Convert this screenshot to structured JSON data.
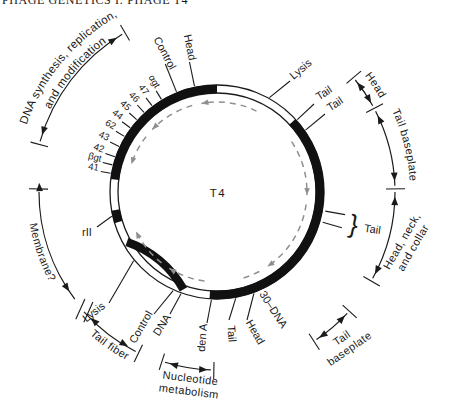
{
  "header": {
    "running_head": "PHAGE GENETICS I: PHAGE T4"
  },
  "map": {
    "center_label": "T4",
    "genes": [
      "41",
      "βgt",
      "42",
      "43",
      "62",
      "44",
      "45",
      "46",
      "47",
      "αgt"
    ],
    "ring_labels": {
      "control_top": "Control",
      "head_top": "Head",
      "lysis_upper": "Lysis",
      "tail_upper_1": "Tail",
      "tail_upper_2": "Tail",
      "tail_brace_label": "Tail",
      "brace_glyph": "}",
      "rii": "rII",
      "lysis_lower": "Lysis",
      "control_bottom": "Control",
      "dna_bottom": "DNA",
      "den_a": "den A",
      "tail_bottom": "Tail",
      "head_bottom": "Head",
      "dna_30": "30–DNA"
    },
    "annotations": {
      "dna_synthesis_line1": "DNA synthesis, replication,",
      "dna_synthesis_line2": "and modification",
      "head_right": "Head",
      "tail_baseplate_right": "Tail baseplate",
      "head_neck_collar_line1": "Head, neck,",
      "head_neck_collar_line2": "and collar",
      "tail_baseplate_bottom_line1": "Tail",
      "tail_baseplate_bottom_line2": "baseplate",
      "membrane": "Membrane?",
      "tail_fiber": "Tail fiber",
      "nucleotide_line1": "Nucleotide",
      "nucleotide_line2": "metabolism"
    },
    "colors": {
      "ink": "#1a1a1a",
      "dashed_arrows": "#8f8f8f",
      "background": "#ffffff"
    }
  }
}
